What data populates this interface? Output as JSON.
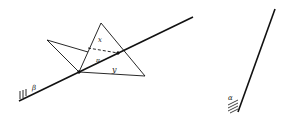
{
  "figure": {
    "left_diagram": {
      "plane_label": "β",
      "region_labels": {
        "upper": "x",
        "middle": "π",
        "lower": "y"
      }
    },
    "right_diagram": {
      "plane_label": "α"
    }
  }
}
